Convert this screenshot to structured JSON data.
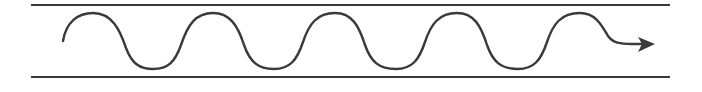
{
  "diagram": {
    "colors": {
      "background": "#ffffff",
      "stroke": "#3a3a3a"
    },
    "boundaries": {
      "top_line": {
        "x1": 31,
        "x2": 670,
        "y": 5
      },
      "bottom_line": {
        "x1": 31,
        "x2": 670,
        "y": 77
      }
    },
    "wave": {
      "start": {
        "x": 63,
        "y": 41
      },
      "peak_y": 13,
      "trough_y": 69,
      "cycles": 4.5,
      "direction": "right"
    },
    "arrow": {
      "icon": "arrow-right-icon",
      "tip": {
        "x": 655,
        "y": 44
      }
    }
  }
}
